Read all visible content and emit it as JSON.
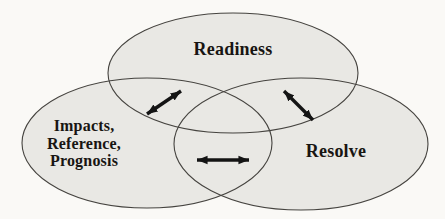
{
  "diagram": {
    "type": "venn-3-ellipses",
    "colors": {
      "page_bg": "#faf9f6",
      "ellipse_fill": "#e9e8e4",
      "ellipse_stroke": "#45433f",
      "arrow": "#141414",
      "text": "#181512"
    },
    "circles": {
      "top": {
        "label": "Readiness"
      },
      "left": {
        "lines": [
          "Impacts,",
          "Reference,",
          "Prognosis"
        ]
      },
      "right": {
        "label": "Resolve"
      }
    },
    "arrows": [
      {
        "name": "readiness-impacts-arrow",
        "between": [
          "Readiness",
          "Impacts, Reference, Prognosis"
        ],
        "style": "double-headed"
      },
      {
        "name": "readiness-resolve-arrow",
        "between": [
          "Readiness",
          "Resolve"
        ],
        "style": "double-headed"
      },
      {
        "name": "impacts-resolve-arrow",
        "between": [
          "Impacts, Reference, Prognosis",
          "Resolve"
        ],
        "style": "double-headed"
      }
    ]
  }
}
